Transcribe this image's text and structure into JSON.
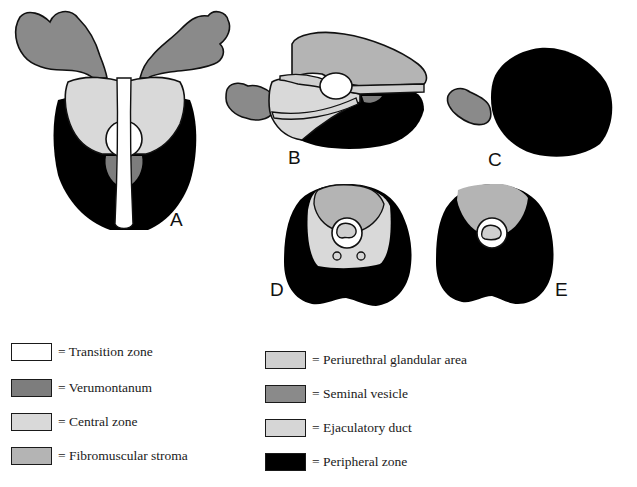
{
  "figure": {
    "panels": [
      {
        "id": "A",
        "label": "A"
      },
      {
        "id": "B",
        "label": "B"
      },
      {
        "id": "C",
        "label": "C"
      },
      {
        "id": "D",
        "label": "D"
      },
      {
        "id": "E",
        "label": "E"
      }
    ]
  },
  "colors": {
    "transition_zone": "#ffffff",
    "verumontanum": "#7d7d7d",
    "central_zone": "#d9d9d9",
    "fibromuscular_stroma": "#b4b4b4",
    "periurethral_glandular_area": "#cfcfcf",
    "seminal_vesicle": "#8a8a8a",
    "ejaculatory_duct": "#d6d6d6",
    "peripheral_zone": "#000000",
    "outline": "#111111"
  },
  "legend": {
    "left": [
      {
        "key": "transition_zone",
        "label": "= Transition zone"
      },
      {
        "key": "verumontanum",
        "label": "= Verumontanum"
      },
      {
        "key": "central_zone",
        "label": "= Central zone"
      },
      {
        "key": "fibromuscular_stroma",
        "label": "= Fibromuscular stroma"
      }
    ],
    "right": [
      {
        "key": "periurethral_glandular_area",
        "label": "= Periurethral glandular area"
      },
      {
        "key": "seminal_vesicle",
        "label": "= Seminal vesicle"
      },
      {
        "key": "ejaculatory_duct",
        "label": "= Ejaculatory duct"
      },
      {
        "key": "peripheral_zone",
        "label": "= Peripheral zone"
      }
    ]
  }
}
